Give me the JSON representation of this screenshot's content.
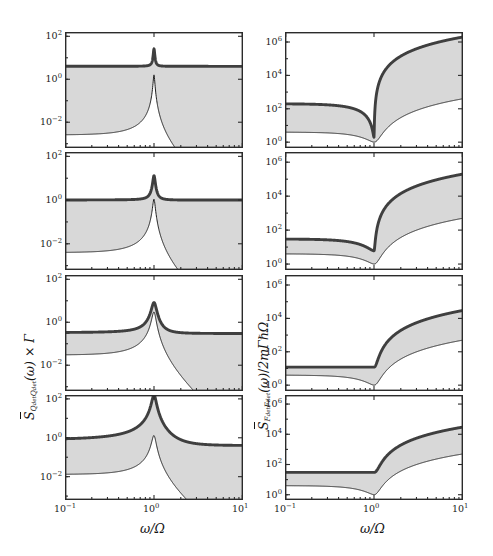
{
  "figure": {
    "title": "",
    "rows": 4,
    "columns": 2,
    "background": "#ffffff",
    "thick_line_color": "#3f3f3f",
    "thin_line_color": "#1f1f1f",
    "band_color": "#c9c9c9"
  },
  "axes": {
    "x_label": "ω/Ω",
    "x_ticks": [
      "10⁻¹",
      "10⁰",
      "10¹"
    ],
    "x_tick_mantissa": [
      "10",
      "10",
      "10"
    ],
    "x_tick_exponent": [
      "-1",
      "0",
      "1"
    ],
    "x_range_log": [
      -1,
      1
    ],
    "y_label_left_parts": {
      "symbol": "S",
      "subscript": "Q_det Q_det",
      "arg": "(ω)",
      "factor": "× Γ"
    },
    "y_label_left": "S̄_{Q_det Q_det}(ω) × Γ",
    "y_label_right_parts": {
      "symbol": "S",
      "subscript": "F_det F_det",
      "arg": "(ω)",
      "divisor": "/ 2mΓħΩ"
    },
    "y_label_right": "S̄_{F_det F_det}(ω) / 2mΓħΩ",
    "left_y_ticks": [
      "10²",
      "10⁰",
      "10⁻²"
    ],
    "left_y_tick_exponent": [
      "2",
      "0",
      "-2"
    ],
    "left_y_range_log": [
      -3.2,
      2.2
    ],
    "right_y_ticks": [
      "10⁶",
      "10⁴",
      "10²",
      "10⁰"
    ],
    "right_y_tick_exponent": [
      "6",
      "4",
      "2",
      "0"
    ],
    "right_y_range_log": [
      -0.35,
      6.6
    ]
  },
  "chart_data": {
    "type": "line",
    "title": "",
    "xlabel": "ω/Ω",
    "ylabel_left": "S̄_{Q_det Q_det}(ω) × Γ",
    "ylabel_right": "S̄_{F_det F_det}(ω) / 2mΓħΩ",
    "xscale": "log",
    "yscale": "log",
    "xlim": [
      0.1,
      10
    ],
    "grid": false,
    "legend": "none",
    "panels": [
      {
        "id": "left-1",
        "row": 1,
        "column": "left",
        "ylim": [
          0.000631,
          158.5
        ],
        "yticks_log": [
          2,
          0,
          -2
        ],
        "series": [
          {
            "name": "total-detector-spectrum",
            "style": "thick",
            "description": "flat background near 4 with sharp Lorentzian peak at ω/Ω=1 reaching ~22",
            "model": {
              "kind": "flat_plus_lorentzian",
              "background": 4.0,
              "peak": 22.0,
              "width": 0.018,
              "center": 1.0
            }
          },
          {
            "name": "intrinsic-spectrum",
            "style": "thin",
            "description": "Lorentzian response rising from ~0.11 at ω/Ω=0.1 to ~1.6 at resonance then decaying as ω⁻⁴",
            "model": {
              "kind": "lorentzian_response",
              "amplitude": 1.6,
              "width": 0.02,
              "low": 0.11
            }
          },
          {
            "name": "uncertainty-band",
            "style": "band",
            "description": "narrow gray band hugging the thick curve around the peak"
          }
        ]
      },
      {
        "id": "left-2",
        "row": 2,
        "column": "left",
        "ylim": [
          0.000631,
          158.5
        ],
        "yticks_log": [
          2,
          0,
          -2
        ],
        "series": [
          {
            "name": "total-detector-spectrum",
            "style": "thick",
            "description": "flat background near 1.0 with peak to ~12 at ω/Ω=1",
            "model": {
              "kind": "flat_plus_lorentzian",
              "background": 1.0,
              "peak": 12.0,
              "width": 0.03,
              "center": 1.0
            }
          },
          {
            "name": "intrinsic-spectrum",
            "style": "thin",
            "description": "rises from ~0.1 to ~1.1 at resonance then decays",
            "model": {
              "kind": "lorentzian_response",
              "amplitude": 1.1,
              "width": 0.03,
              "low": 0.1
            }
          },
          {
            "name": "uncertainty-band",
            "style": "band",
            "description": "gray band between thin and thick curves, widest near resonance"
          }
        ]
      },
      {
        "id": "left-3",
        "row": 3,
        "column": "left",
        "ylim": [
          0.000631,
          158.5
        ],
        "yticks_log": [
          2,
          0,
          -2
        ],
        "series": [
          {
            "name": "total-detector-spectrum",
            "style": "thick",
            "description": "plateau near 0.3 with broad peak to ~8 at resonance, decays to plateau ~0.1",
            "model": {
              "kind": "flat_plus_lorentzian",
              "background": 0.3,
              "peak": 8.0,
              "width": 0.06,
              "center": 1.0
            }
          },
          {
            "name": "intrinsic-spectrum",
            "style": "thin",
            "description": "rises from ~0.13 to peak ~3 then decays as ω⁻⁴",
            "model": {
              "kind": "lorentzian_response",
              "amplitude": 3.0,
              "width": 0.05,
              "low": 0.13
            }
          },
          {
            "name": "uncertainty-band",
            "style": "band",
            "description": "wide gray band between the two curves on the low-frequency plateau"
          }
        ]
      },
      {
        "id": "left-4",
        "row": 4,
        "column": "left",
        "ylim": [
          0.000631,
          158.5
        ],
        "yticks_log": [
          2,
          0,
          -2
        ],
        "series": [
          {
            "name": "total-detector-spectrum",
            "style": "thick",
            "description": "plateau near 0.4 rising to a tall narrow peak above 100 at resonance",
            "model": {
              "kind": "flat_plus_lorentzian",
              "background": 0.4,
              "peak": 160.0,
              "width": 0.05,
              "center": 1.0
            }
          },
          {
            "name": "intrinsic-spectrum",
            "style": "thin",
            "description": "rises from ~0.09 to peak ~1.3 then decays steeply",
            "model": {
              "kind": "lorentzian_response",
              "amplitude": 1.3,
              "width": 0.05,
              "low": 0.09
            }
          },
          {
            "name": "uncertainty-band",
            "style": "band",
            "description": "thin gray band hugging the thick curve"
          }
        ]
      },
      {
        "id": "right-1",
        "row": 1,
        "column": "right",
        "ylim": [
          0.447,
          3981000
        ],
        "yticks_log": [
          6,
          4,
          2,
          0
        ],
        "series": [
          {
            "name": "total-force-spectrum",
            "style": "thick",
            "description": "starts near 200, dips to ~2 at ω/Ω=1, then rises steeply as ω⁴ to ~2×10⁶",
            "model": {
              "kind": "force_noise",
              "low": 200.0,
              "dip": 2.0,
              "high": 2000000.0
            }
          },
          {
            "name": "intrinsic-force-spectrum",
            "style": "thin",
            "description": "starts near 4, dips to 1 at resonance, rises to ~400 at ω/Ω=10",
            "model": {
              "kind": "force_noise",
              "low": 4.0,
              "dip": 1.0,
              "high": 400.0
            }
          },
          {
            "name": "uncertainty-band",
            "style": "band",
            "description": "small gray wedge just left of the dip at resonance"
          }
        ]
      },
      {
        "id": "right-2",
        "row": 2,
        "column": "right",
        "ylim": [
          0.447,
          3981000
        ],
        "yticks_log": [
          6,
          4,
          2,
          0
        ],
        "series": [
          {
            "name": "total-force-spectrum",
            "style": "thick",
            "description": "starts near 30, shallow dip to ~6 at resonance, rises to ~2×10⁵",
            "model": {
              "kind": "force_noise",
              "low": 30.0,
              "dip": 6.0,
              "high": 200000.0
            }
          },
          {
            "name": "intrinsic-force-spectrum",
            "style": "thin",
            "description": "starts near 4, dips to 1 at resonance, rises to ~500",
            "model": {
              "kind": "force_noise",
              "low": 4.0,
              "dip": 1.0,
              "high": 500.0
            }
          },
          {
            "name": "uncertainty-band",
            "style": "band",
            "description": "gray wedge between the curves widening toward resonance"
          }
        ]
      },
      {
        "id": "right-3",
        "row": 3,
        "column": "right",
        "ylim": [
          0.447,
          3981000
        ],
        "yticks_log": [
          6,
          4,
          2,
          0
        ],
        "series": [
          {
            "name": "total-force-spectrum",
            "style": "thick",
            "description": "flat near 12 across the low-frequency range, rises after resonance to ~3×10⁴",
            "model": {
              "kind": "force_plateau",
              "plateau": 12.0,
              "high": 30000.0
            }
          },
          {
            "name": "intrinsic-force-spectrum",
            "style": "thin",
            "description": "flat near 4, sharp dip to 1 at resonance, rises to ~500",
            "model": {
              "kind": "force_noise",
              "low": 4.0,
              "dip": 1.0,
              "high": 500.0
            }
          },
          {
            "name": "uncertainty-band",
            "style": "band",
            "description": "broad gray band filling the region between the flat curves"
          }
        ]
      },
      {
        "id": "right-4",
        "row": 4,
        "column": "right",
        "ylim": [
          0.447,
          3981000
        ],
        "yticks_log": [
          6,
          4,
          2,
          0
        ],
        "series": [
          {
            "name": "total-force-spectrum",
            "style": "thick",
            "description": "flat near 30 with no dip, rises after resonance to ~3×10⁴",
            "model": {
              "kind": "force_plateau",
              "plateau": 30.0,
              "high": 30000.0
            }
          },
          {
            "name": "intrinsic-force-spectrum",
            "style": "thin",
            "description": "flat near 4, dips to 1 at resonance, rises to ~500",
            "model": {
              "kind": "force_noise",
              "low": 4.0,
              "dip": 1.0,
              "high": 500.0
            }
          },
          {
            "name": "uncertainty-band",
            "style": "band",
            "description": "very thin gray band along the flat thick curve"
          }
        ]
      }
    ]
  },
  "geometry": {
    "panel_left_x": 65,
    "panel_left_w": 178,
    "panel_right_x": 285,
    "panel_right_w": 178,
    "row_tops": [
      32,
      152,
      275,
      395
    ],
    "row_h": [
      116,
      118,
      116,
      105
    ]
  }
}
